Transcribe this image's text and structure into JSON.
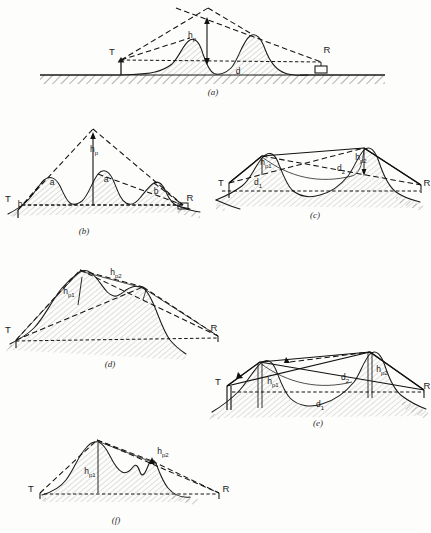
{
  "figure": {
    "domain": "Diagram",
    "background_color": "#fdfdfc",
    "ink_color": "#1b1b1b",
    "panels": [
      {
        "id": "a",
        "caption": "(a)",
        "terminals": {
          "transmitter": "T",
          "receiver": "R"
        },
        "labels": [
          {
            "name": "peak-height",
            "text": "h",
            "sub": "p"
          },
          {
            "name": "distance",
            "text": "d",
            "sub": ""
          }
        ],
        "description": "Single knife-edge double hill, dashed rays crossing above ridge"
      },
      {
        "id": "b",
        "caption": "(b)",
        "terminals": {
          "transmitter": "T",
          "receiver": "R"
        },
        "labels": [
          {
            "name": "peak-height",
            "text": "h",
            "sub": "p"
          },
          {
            "name": "angle-a-left",
            "text": "a",
            "sub": ""
          },
          {
            "name": "angle-a-right",
            "text": "a",
            "sub": ""
          },
          {
            "name": "angle-b-right",
            "text": "b",
            "sub": ""
          },
          {
            "name": "angle-b-left",
            "text": "b",
            "sub": ""
          }
        ],
        "description": "Three successive ridges with dashed envelope triangle"
      },
      {
        "id": "c",
        "caption": "(c)",
        "terminals": {
          "transmitter": "T",
          "receiver": "R"
        },
        "labels": [
          {
            "name": "peak-height-1",
            "text": "h",
            "sub": "p1"
          },
          {
            "name": "distance-1",
            "text": "d",
            "sub": "1"
          },
          {
            "name": "peak-height-2",
            "text": "h",
            "sub": "p2"
          },
          {
            "name": "distance-2",
            "text": "d",
            "sub": "2"
          }
        ],
        "description": "Two obstacles with solid chord path and crossed dashed rays"
      },
      {
        "id": "d",
        "caption": "(d)",
        "terminals": {
          "transmitter": "T",
          "receiver": "R"
        },
        "labels": [
          {
            "name": "peak-height-1",
            "text": "h",
            "sub": "p1"
          },
          {
            "name": "peak-height-2",
            "text": "h",
            "sub": "p2"
          }
        ],
        "description": "Sloping ridge with secondary peak, long dashed path to R"
      },
      {
        "id": "e",
        "caption": "(e)",
        "terminals": {
          "transmitter": "T",
          "receiver": "R"
        },
        "labels": [
          {
            "name": "peak-height-1",
            "text": "h",
            "sub": "p1"
          },
          {
            "name": "peak-height-2",
            "text": "h",
            "sub": "p2"
          },
          {
            "name": "distance-1",
            "text": "d",
            "sub": "1"
          },
          {
            "name": "distance-2",
            "text": "d",
            "sub": "2"
          }
        ],
        "description": "Two peaks with vertical height posts and baseline distance d1"
      },
      {
        "id": "f",
        "caption": "(f)",
        "terminals": {
          "transmitter": "T",
          "receiver": "R"
        },
        "labels": [
          {
            "name": "peak-height-1",
            "text": "h",
            "sub": "p1"
          },
          {
            "name": "peak-height-2",
            "text": "h",
            "sub": "p2"
          }
        ],
        "description": "Main hill with small secondary knife edge on descending slope"
      }
    ]
  }
}
